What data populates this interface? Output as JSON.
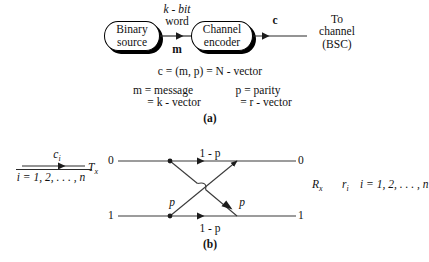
{
  "figure": {
    "panel_a": {
      "caption": "(a)",
      "source_block": {
        "line1": "Binary",
        "line2": "source"
      },
      "encoder_block": {
        "line1": "Channel",
        "line2": "encoder"
      },
      "k_bit_word": {
        "line1": "k - bit",
        "line2": "word"
      },
      "m_label": "m",
      "c_label": "c",
      "destination": {
        "line1": "To",
        "line2": "channel",
        "line3": "(BSC)"
      },
      "equation_c": "c = (m, p) = N - vector",
      "equation_m": {
        "line1": "m = message",
        "line2": "= k - vector"
      },
      "equation_p": {
        "line1": "p = parity",
        "line2": "= r - vector"
      }
    },
    "panel_b": {
      "caption": "(b)",
      "input_symbol": "c",
      "input_subscript": "i",
      "input_range": "i = 1, 2, . . . , n",
      "tx_label": "T",
      "tx_subscript": "x",
      "rx_label": "R",
      "rx_subscript": "x",
      "output_symbol": "r",
      "output_subscript": "i",
      "output_range": "i = 1, 2, . . . , n",
      "in_top": "0",
      "in_bottom": "1",
      "out_top": "0",
      "out_bottom": "1",
      "prob_correct_top": "1 - p",
      "prob_correct_bottom": "1 - p",
      "prob_error_up": "p",
      "prob_error_down": "p"
    },
    "colors": {
      "ink": "#111111",
      "line": "#3a3a3a",
      "background": "#ffffff"
    }
  }
}
